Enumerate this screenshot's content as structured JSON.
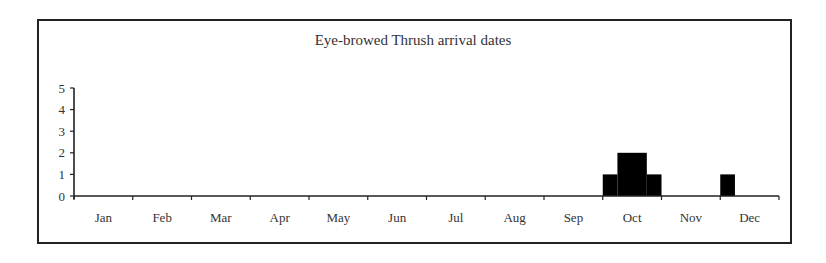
{
  "chart_data": {
    "type": "bar",
    "title": "Eye-browed Thrush arrival dates",
    "xlabel": "",
    "ylabel": "",
    "ylim": [
      0,
      5
    ],
    "yticks": [
      0,
      1,
      2,
      3,
      4,
      5
    ],
    "categories": [
      "Jan",
      "Feb",
      "Mar",
      "Apr",
      "May",
      "Jun",
      "Jul",
      "Aug",
      "Sep",
      "Oct",
      "Nov",
      "Dec"
    ],
    "grid": false,
    "legend": null,
    "bins": [
      {
        "month": "Oct",
        "period": "early Oct",
        "start_frac": 9.0,
        "end_frac": 9.25,
        "value": 1
      },
      {
        "month": "Oct",
        "period": "mid Oct",
        "start_frac": 9.25,
        "end_frac": 9.75,
        "value": 2
      },
      {
        "month": "Oct",
        "period": "late Oct",
        "start_frac": 9.75,
        "end_frac": 10.0,
        "value": 1
      },
      {
        "month": "Dec",
        "period": "early Dec",
        "start_frac": 11.0,
        "end_frac": 11.25,
        "value": 1
      }
    ],
    "values": [
      0,
      0,
      0,
      0,
      0,
      0,
      0,
      0,
      0,
      4,
      0,
      1
    ]
  },
  "colors": {
    "bar": "#000000",
    "axis": "#222222",
    "text": "#333333"
  }
}
